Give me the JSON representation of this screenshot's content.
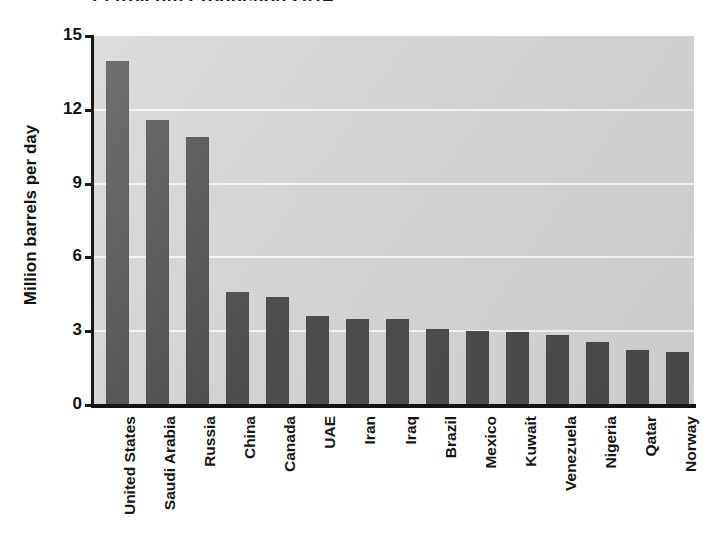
{
  "chart_data": {
    "type": "bar",
    "title": "Petroleum Production 2014",
    "xlabel": "",
    "ylabel": "Million barrels per day",
    "ylim": [
      0,
      15
    ],
    "yticks": [
      0,
      3,
      6,
      9,
      12,
      15
    ],
    "ytick_labels": [
      "0",
      "3",
      "6",
      "9",
      "12",
      "15"
    ],
    "grid": true,
    "grid_axis": "y",
    "legend": "none",
    "bar_color": "#4a4a4a",
    "plot_background": "#d2d2d2",
    "categories": [
      "United States",
      "Saudi Arabia",
      "Russia",
      "China",
      "Canada",
      "UAE",
      "Iran",
      "Iraq",
      "Brazil",
      "Mexico",
      "Kuwait",
      "Venezuela",
      "Nigeria",
      "Qatar",
      "Norway"
    ],
    "values": [
      14.0,
      11.6,
      10.9,
      4.6,
      4.4,
      3.6,
      3.5,
      3.5,
      3.1,
      3.0,
      2.95,
      2.85,
      2.55,
      2.25,
      2.15
    ],
    "units": "million barrels per day"
  },
  "axis": {
    "y_title": "Million barrels per day",
    "y_tick_labels": [
      "15",
      "12",
      "9",
      "6",
      "3",
      "0"
    ]
  },
  "header": {
    "title": "Petroleum Production 2014"
  }
}
